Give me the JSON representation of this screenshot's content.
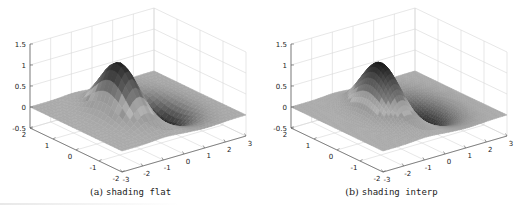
{
  "figure": {
    "panels": [
      {
        "id": "a",
        "caption_prefix": "(a)",
        "caption_code": "shading flat"
      },
      {
        "id": "b",
        "caption_prefix": "(b)",
        "caption_code": "shading interp"
      }
    ]
  },
  "chart_data": [
    {
      "type": "surface",
      "title": "",
      "caption": "(a) shading flat",
      "shading": "flat",
      "function": "z = peak at (x≈-1, y≈0) of height ≈1.25, trough at (x≈1, y≈0) of depth ≈-0.5, flat ≈0 elsewhere",
      "colormap": "gray",
      "xlim": [
        -3,
        3
      ],
      "ylim": [
        -2,
        2
      ],
      "zlim": [
        -0.5,
        1.5
      ],
      "xticks": [
        "-3",
        "-2",
        "-1",
        "0",
        "1",
        "2",
        "3"
      ],
      "yticks": [
        "-2",
        "-1",
        "0",
        "1",
        "2"
      ],
      "zticks": [
        "-0.5",
        "0",
        "0.5",
        "1",
        "1.5"
      ],
      "grid": true,
      "view": "3d"
    },
    {
      "type": "surface",
      "title": "",
      "caption": "(b) shading interp",
      "shading": "interp",
      "function": "z = peak at (x≈-1, y≈0) of height ≈1.25, trough at (x≈1, y≈0) of depth ≈-0.5, flat ≈0 elsewhere",
      "colormap": "gray",
      "xlim": [
        -3,
        3
      ],
      "ylim": [
        -2,
        2
      ],
      "zlim": [
        -0.5,
        1.5
      ],
      "xticks": [
        "-3",
        "-2",
        "-1",
        "0",
        "1",
        "2",
        "3"
      ],
      "yticks": [
        "-2",
        "-1",
        "0",
        "1",
        "2"
      ],
      "zticks": [
        "-0.5",
        "0",
        "0.5",
        "1",
        "1.5"
      ],
      "grid": true,
      "view": "3d"
    }
  ]
}
